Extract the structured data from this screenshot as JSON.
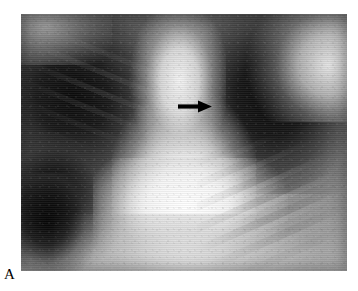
{
  "figure": {
    "label": "A",
    "modality": "chest radiograph",
    "view": "PA (frontal)",
    "panel": {
      "x": 21,
      "y": 14,
      "width": 326,
      "height": 257
    }
  },
  "annotations": [
    {
      "name": "arrow-marker",
      "icon": "arrow-right-icon",
      "direction": "right",
      "color": "#000000",
      "x": 178,
      "y": 99,
      "width": 34,
      "height": 15,
      "tip_x": 212,
      "points_to": "right mediastinal border"
    }
  ],
  "image_regions": {
    "lung_field_right": "dark aerated lung, viewer left",
    "lung_field_left": "dark aerated lung, viewer right",
    "mediastinum": "markedly widened bright central mediastinal silhouette",
    "cardiac_silhouette": "bright opacity lower central",
    "apex_right_chest_wall": "bright soft tissue and clavicle, upper right",
    "costophrenic_angle_left": "dark angle, lower left",
    "rib_shadows": "oblique rib bands, lower right",
    "diaphragm": "brightening along lower border"
  },
  "colors": {
    "page_background": "#ffffff",
    "film_dark": "#0a0a0a",
    "film_mid": "#7d7d7d",
    "film_bright": "#ffffff",
    "annotation": "#000000",
    "label_text": "#000000"
  }
}
